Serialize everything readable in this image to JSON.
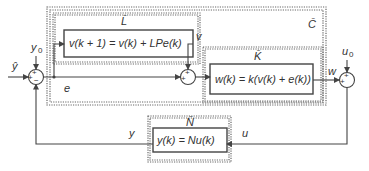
{
  "diagram": {
    "blocks": {
      "C": {
        "label": "C̄"
      },
      "L": {
        "label": "L̄",
        "equation": "v(k + 1) = v(k) + LPe(k)"
      },
      "K": {
        "label": "K̄",
        "equation": "w(k) = k(v(k) + e(k))"
      },
      "N": {
        "label": "N̄",
        "equation": "y(k) = Nu(k)"
      }
    },
    "signals": {
      "input": "ŷ",
      "y0": "y",
      "y0_sub": "0",
      "u0": "u",
      "u0_sub": "0",
      "e": "e",
      "v": "v",
      "w": "w",
      "y": "y",
      "u": "u"
    },
    "junctions": {
      "left": {
        "signs": [
          "+",
          "+",
          "−"
        ]
      },
      "middle": {
        "signs": [
          "+",
          "+"
        ]
      },
      "right": {
        "signs": [
          "+",
          "+"
        ]
      }
    }
  }
}
